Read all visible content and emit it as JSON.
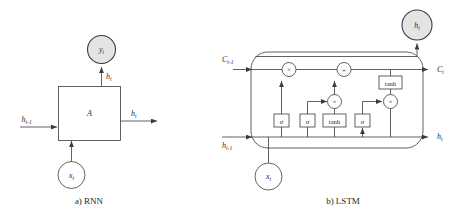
{
  "figure": {
    "background": "#ffffff",
    "line_color": "#3b3b3b",
    "shaded_fill": "#e4e4e4",
    "white_fill": "#ffffff"
  },
  "panels": [
    {
      "id": "rnn",
      "caption": "a)  RNN",
      "cell_label": "A",
      "nodes": {
        "output_circle": {
          "base": "y",
          "sub": "t",
          "filled": true
        },
        "input_circle": {
          "base": "x",
          "sub": "t",
          "filled": false
        }
      },
      "edges": [
        {
          "name": "hidden-in",
          "base": "h",
          "sub": "t-1"
        },
        {
          "name": "hidden-out",
          "base": "h",
          "sub": "t"
        },
        {
          "name": "hidden-up",
          "base": "h",
          "sub": "t"
        }
      ]
    },
    {
      "id": "lstm",
      "caption": "b)  LSTM",
      "nodes": {
        "output_circle": {
          "base": "h",
          "sub": "t",
          "filled": true
        },
        "input_circle": {
          "base": "x",
          "sub": "t",
          "filled": false
        }
      },
      "edges": [
        {
          "name": "cell-in",
          "base": "C",
          "sub": "t-1"
        },
        {
          "name": "cell-out",
          "base": "C",
          "sub": "t"
        },
        {
          "name": "hidden-in",
          "base": "h",
          "sub": "t-1"
        },
        {
          "name": "hidden-out",
          "base": "h",
          "sub": "t"
        }
      ],
      "operators": [
        {
          "name": "forget-multiply",
          "glyph": "×"
        },
        {
          "name": "input-add",
          "glyph": "+"
        },
        {
          "name": "input-multiply",
          "glyph": "×"
        },
        {
          "name": "output-multiply",
          "glyph": "×"
        }
      ],
      "gates": [
        {
          "name": "forget-gate",
          "label": "σ"
        },
        {
          "name": "input-gate",
          "label": "σ"
        },
        {
          "name": "candidate-gate",
          "label": "tanh"
        },
        {
          "name": "output-gate",
          "label": "σ"
        },
        {
          "name": "cell-tanh",
          "label": "tanh"
        }
      ]
    }
  ]
}
